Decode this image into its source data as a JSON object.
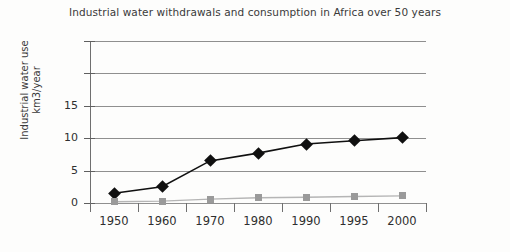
{
  "chart_data": {
    "type": "line",
    "title": "Industrial water withdrawals and consumption in Africa over 50 years",
    "xlabel": "",
    "ylabel": "Industrial water use km3/year",
    "ylabel_line1": "Industrial water use",
    "ylabel_line2": "km3/year",
    "categories": [
      "1950",
      "1960",
      "1970",
      "1980",
      "1990",
      "1995",
      "2000"
    ],
    "ytick_labels": [
      "0",
      "5",
      "10",
      "15"
    ],
    "ytick_values": [
      0,
      5,
      10,
      15
    ],
    "ylim": [
      0,
      25
    ],
    "xlim_note": "categorical, equal spacing",
    "grid": "horizontal",
    "legend": "none",
    "series": [
      {
        "name": "Industrial water withdrawals",
        "marker": "diamond",
        "color": "#101010",
        "values": [
          1.5,
          2.5,
          6.5,
          7.7,
          9.1,
          9.6,
          10.1
        ]
      },
      {
        "name": "Industrial water consumption",
        "marker": "square",
        "color": "#9a9a9a",
        "values": [
          0.2,
          0.3,
          0.6,
          0.8,
          0.9,
          1.0,
          1.1
        ]
      }
    ]
  },
  "colors": {
    "withdrawals": "#101010",
    "consumption": "#9a9a9a",
    "grid": "#8f8f8f",
    "axis": "#6f6f6f",
    "text": "#2f2f2f",
    "background": "#fdfdfc"
  }
}
